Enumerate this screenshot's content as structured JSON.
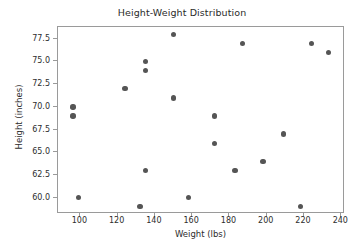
{
  "chart_data": {
    "type": "scatter",
    "title": "Height-Weight Distribution",
    "xlabel": "Weight (lbs)",
    "ylabel": "Height (inches)",
    "xlim": [
      88,
      242
    ],
    "ylim": [
      58.2,
      78.8
    ],
    "grid": false,
    "legend": null,
    "marker_color": "#555555",
    "xticks": [
      100,
      120,
      140,
      160,
      180,
      200,
      220,
      240
    ],
    "xtick_labels": [
      "100",
      "120",
      "140",
      "160",
      "180",
      "200",
      "220",
      "240"
    ],
    "yticks": [
      60.0,
      62.5,
      65.0,
      67.5,
      70.0,
      72.5,
      75.0,
      77.5
    ],
    "ytick_labels": [
      "60.0",
      "62.5",
      "65.0",
      "67.5",
      "70.0",
      "72.5",
      "75.0",
      "77.5"
    ],
    "points": [
      {
        "x": 96,
        "y": 70
      },
      {
        "x": 96,
        "y": 69
      },
      {
        "x": 99,
        "y": 60
      },
      {
        "x": 124,
        "y": 72
      },
      {
        "x": 132,
        "y": 59
      },
      {
        "x": 135,
        "y": 75
      },
      {
        "x": 135,
        "y": 74
      },
      {
        "x": 135,
        "y": 63
      },
      {
        "x": 150,
        "y": 78
      },
      {
        "x": 150,
        "y": 71
      },
      {
        "x": 158,
        "y": 60
      },
      {
        "x": 172,
        "y": 69
      },
      {
        "x": 172,
        "y": 66
      },
      {
        "x": 183,
        "y": 63
      },
      {
        "x": 187,
        "y": 77
      },
      {
        "x": 198,
        "y": 64
      },
      {
        "x": 209,
        "y": 67
      },
      {
        "x": 218,
        "y": 59
      },
      {
        "x": 224,
        "y": 77
      },
      {
        "x": 233,
        "y": 76
      }
    ]
  }
}
